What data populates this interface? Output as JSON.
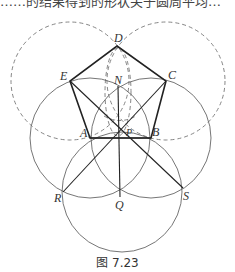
{
  "top_text": "……的结果得到的形状关于圆周平均…",
  "figure": {
    "caption": "图 7.23",
    "points": {
      "D": {
        "label": "D",
        "x": 117,
        "y": 46
      },
      "E": {
        "label": "E",
        "x": 70,
        "y": 81
      },
      "C": {
        "label": "C",
        "x": 166,
        "y": 81
      },
      "A": {
        "label": "A",
        "x": 90,
        "y": 138
      },
      "B": {
        "label": "B",
        "x": 151,
        "y": 138
      },
      "N": {
        "label": "N",
        "x": 118,
        "y": 86
      },
      "P": {
        "label": "P",
        "x": 120,
        "y": 129
      },
      "Q": {
        "label": "Q",
        "x": 120,
        "y": 197
      },
      "R": {
        "label": "R",
        "x": 63,
        "y": 192
      },
      "S": {
        "label": "S",
        "x": 183,
        "y": 188
      }
    },
    "colors": {
      "line": "#222222",
      "circle": "#666666",
      "dashed": "#777777"
    }
  }
}
